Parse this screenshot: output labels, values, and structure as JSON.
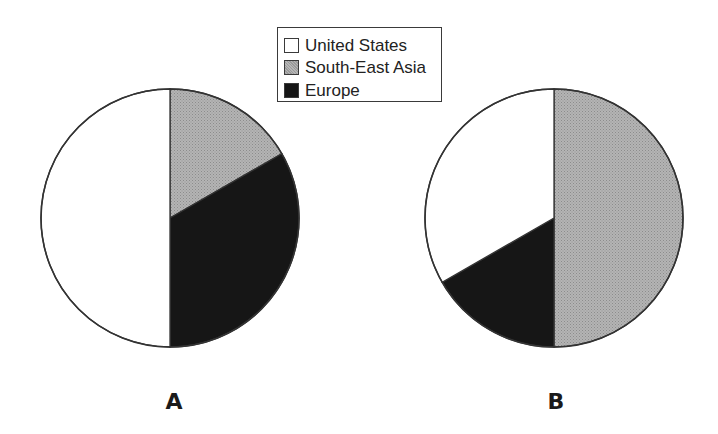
{
  "chart_data": {
    "type": "pie",
    "legend": {
      "position": "top-center",
      "entries": [
        {
          "label": "United States",
          "color": "#ffffff"
        },
        {
          "label": "South-East Asia",
          "color": "#a9a9a9"
        },
        {
          "label": "Europe",
          "color": "#161616"
        }
      ]
    },
    "charts": [
      {
        "label": "A",
        "categories": [
          "United States",
          "South-East Asia",
          "Europe"
        ],
        "values": [
          50,
          16.7,
          33.3
        ],
        "unit": "%"
      },
      {
        "label": "B",
        "categories": [
          "United States",
          "South-East Asia",
          "Europe"
        ],
        "values": [
          33.3,
          50,
          16.7
        ],
        "unit": "%"
      }
    ]
  },
  "colors": {
    "outline": "#333333",
    "united_states": "#ffffff",
    "south_east_asia": "#a9a9a9",
    "europe": "#161616"
  },
  "legend": {
    "items": [
      {
        "label": "United States"
      },
      {
        "label": "South-East Asia"
      },
      {
        "label": "Europe"
      }
    ]
  },
  "pies": {
    "a": {
      "label": "A"
    },
    "b": {
      "label": "B"
    }
  }
}
